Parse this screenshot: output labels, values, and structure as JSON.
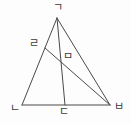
{
  "figure": {
    "canvas": {
      "width": 131,
      "height": 123,
      "background": "#fdfdfd"
    },
    "style": {
      "stroke_color": "#4a4a4a",
      "stroke_width": 1,
      "label_color": "#3a3a3a",
      "label_font_size": 11
    },
    "points": [
      {
        "id": "A",
        "label": "ㄱ",
        "x": 57,
        "y": 18,
        "label_x": 58,
        "label_y": 8,
        "role": "apex-vertex"
      },
      {
        "id": "B",
        "label": "ㄹ",
        "x": 45,
        "y": 48,
        "label_x": 34,
        "label_y": 44,
        "role": "point-on-left-side"
      },
      {
        "id": "C",
        "label": "ㅁ",
        "x": 66,
        "y": 57,
        "label_x": 68,
        "label_y": 57,
        "role": "intersection-point"
      },
      {
        "id": "D",
        "label": "ㄴ",
        "x": 22,
        "y": 105,
        "label_x": 15,
        "label_y": 109,
        "role": "bottom-left-vertex"
      },
      {
        "id": "E",
        "label": "ㄷ",
        "x": 65,
        "y": 105,
        "label_x": 64,
        "label_y": 112,
        "role": "point-on-base"
      },
      {
        "id": "F",
        "label": "ㅂ",
        "x": 110,
        "y": 105,
        "label_x": 119,
        "label_y": 107,
        "role": "bottom-right-vertex"
      }
    ],
    "segments": [
      {
        "id": "s1",
        "name": "side-apex-to-bottom-left",
        "from": "A",
        "to": "D"
      },
      {
        "id": "s2",
        "name": "side-apex-to-bottom-right",
        "from": "A",
        "to": "F"
      },
      {
        "id": "s3",
        "name": "base-bottom-left-to-bottom-right",
        "from": "D",
        "to": "F"
      },
      {
        "id": "s4",
        "name": "cevian-apex-to-base-point",
        "from": "A",
        "to": "E"
      },
      {
        "id": "s5",
        "name": "cevian-left-point-to-bottom-right",
        "from": "B",
        "to": "F"
      }
    ]
  }
}
